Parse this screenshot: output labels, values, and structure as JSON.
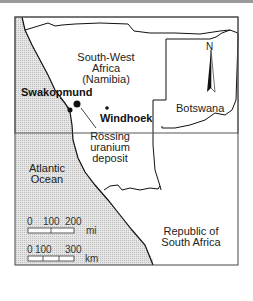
{
  "map": {
    "regions": [
      {
        "id": "namibia",
        "label_lines": [
          "South-West",
          "Africa",
          "(Namibia)"
        ]
      },
      {
        "id": "botswana",
        "label_lines": [
          "Botswana"
        ]
      },
      {
        "id": "south_africa",
        "label_lines": [
          "Republic of",
          "South Africa"
        ]
      },
      {
        "id": "atlantic",
        "label_lines": [
          "Atlantic",
          "Ocean"
        ]
      }
    ],
    "places": [
      {
        "id": "swakopmund",
        "label": "Swakopmund"
      },
      {
        "id": "windhoek",
        "label": "Windhoek"
      },
      {
        "id": "rossing",
        "label_lines": [
          "Rössing",
          "uranium",
          "deposit"
        ]
      }
    ],
    "north_arrow": {
      "label": "N"
    },
    "scale_bars": [
      {
        "unit": "mi",
        "ticks": [
          "0",
          "100",
          "200"
        ]
      },
      {
        "unit": "km",
        "ticks": [
          "0",
          "100",
          "300"
        ]
      }
    ],
    "colors": {
      "ocean": "#d8d8d8",
      "land": "#ffffff",
      "border": "#111111",
      "frame_top": "#9a9a9a"
    }
  }
}
